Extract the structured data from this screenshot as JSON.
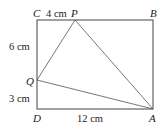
{
  "diagram": {
    "points": {
      "A": "A",
      "B": "B",
      "C": "C",
      "D": "D",
      "P": "P",
      "Q": "Q"
    },
    "lengths": {
      "CP": "4 cm",
      "CQ": "6 cm",
      "QD": "3 cm",
      "DA": "12 cm"
    }
  }
}
